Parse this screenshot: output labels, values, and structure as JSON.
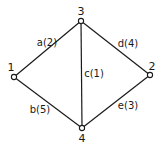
{
  "graph": {
    "nodes": [
      {
        "id": "1",
        "label": "1",
        "x": 14,
        "y": 77,
        "lx": 11,
        "ly": 71
      },
      {
        "id": "2",
        "label": "2",
        "x": 150,
        "y": 75,
        "lx": 152,
        "ly": 70
      },
      {
        "id": "3",
        "label": "3",
        "x": 81,
        "y": 21,
        "lx": 81,
        "ly": 15
      },
      {
        "id": "4",
        "label": "4",
        "x": 82,
        "y": 128,
        "lx": 82,
        "ly": 142
      }
    ],
    "edges": [
      {
        "id": "a",
        "from": "1",
        "to": "3",
        "label": "a(2)",
        "weight": 2,
        "lx": 47,
        "ly": 46
      },
      {
        "id": "b",
        "from": "1",
        "to": "4",
        "label": "b(5)",
        "weight": 5,
        "lx": 40,
        "ly": 113
      },
      {
        "id": "c",
        "from": "3",
        "to": "4",
        "label": "c(1)",
        "weight": 1,
        "lx": 94,
        "ly": 77
      },
      {
        "id": "d",
        "from": "3",
        "to": "2",
        "label": "d(4)",
        "weight": 4,
        "lx": 128,
        "ly": 47
      },
      {
        "id": "e",
        "from": "4",
        "to": "2",
        "label": "e(3)",
        "weight": 3,
        "lx": 128,
        "ly": 109
      }
    ]
  },
  "colors": {
    "line": "#1a1a1a",
    "background": "#ffffff"
  }
}
